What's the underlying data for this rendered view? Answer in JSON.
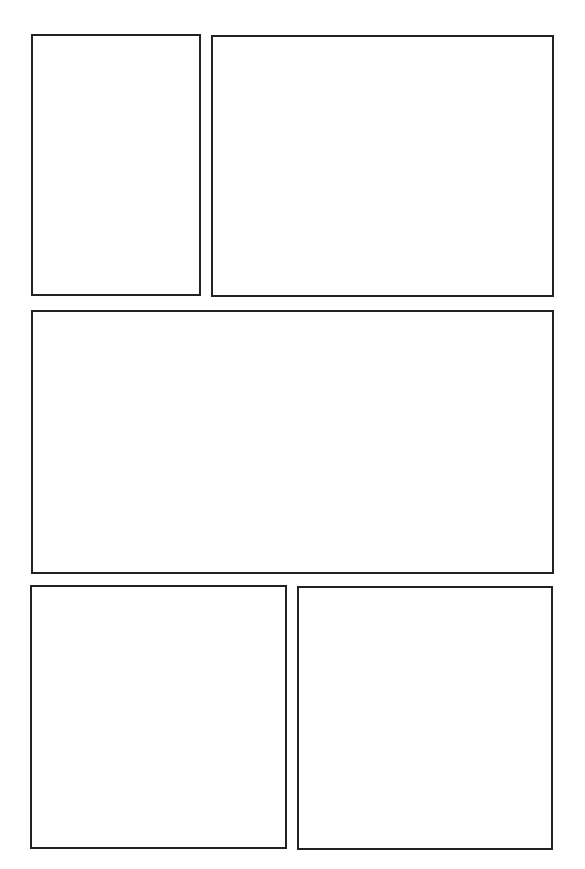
{
  "page": {
    "type": "blank-comic-page-template",
    "background_color": "#ffffff",
    "border_color": "#222222",
    "panel_count": 5
  },
  "panels": [
    {
      "id": "panel-1",
      "row": 1,
      "position": "left",
      "content": ""
    },
    {
      "id": "panel-2",
      "row": 1,
      "position": "right",
      "content": ""
    },
    {
      "id": "panel-3",
      "row": 2,
      "position": "full-width",
      "content": ""
    },
    {
      "id": "panel-4",
      "row": 3,
      "position": "left",
      "content": ""
    },
    {
      "id": "panel-5",
      "row": 3,
      "position": "right",
      "content": ""
    }
  ]
}
